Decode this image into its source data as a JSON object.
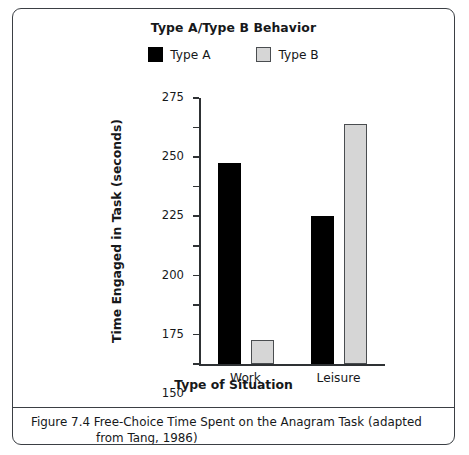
{
  "figure": {
    "caption_label": "Figure 7.4",
    "caption_line1": "Figure 7.4   Free-Choice Time Spent on the Anagram Task (adapted",
    "caption_line2": "from Tang, 1986)"
  },
  "chart_data": {
    "type": "bar",
    "title": "Type A/Type B Behavior",
    "xlabel": "Type of Situation",
    "ylabel": "Time Engaged in Task (seconds)",
    "categories": [
      "Work",
      "Leisure"
    ],
    "series": [
      {
        "name": "Type A",
        "color": "#000000",
        "values": [
          220,
          175
        ]
      },
      {
        "name": "Type B",
        "color": "#d6d6d6",
        "values": [
          70,
          253
        ]
      }
    ],
    "ylim": [
      50,
      275
    ],
    "yticks": [
      50,
      75,
      100,
      125,
      150,
      175,
      200,
      225,
      250,
      275
    ],
    "ytick_labels": [
      "50",
      "75",
      "100",
      "125",
      "150",
      "175",
      "200",
      "225",
      "250",
      "275"
    ],
    "grid": false,
    "legend_position": "top-center"
  }
}
